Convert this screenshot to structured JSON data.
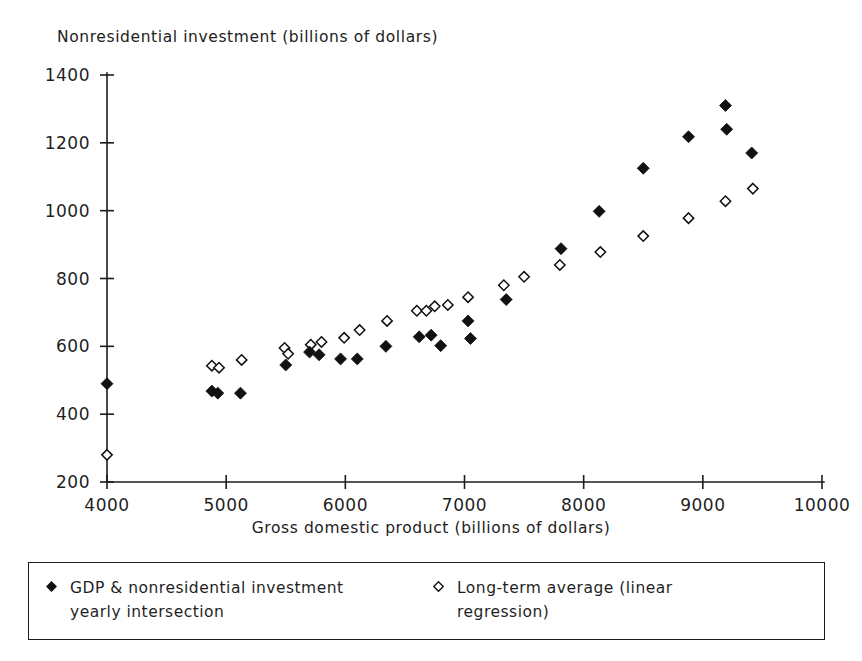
{
  "chart_data": {
    "type": "scatter",
    "title": "",
    "ylabel": "Nonresidential investment (billions of dollars)",
    "xlabel": "Gross domestic product (billions of dollars)",
    "xlim": [
      4000,
      10000
    ],
    "ylim": [
      200,
      1400
    ],
    "xticks": [
      4000,
      5000,
      6000,
      7000,
      8000,
      9000,
      10000
    ],
    "yticks": [
      200,
      400,
      600,
      800,
      1000,
      1200,
      1400
    ],
    "grid": false,
    "legend_position": "below-axes",
    "series": [
      {
        "name": "GDP & nonresidential investment yearly intersection",
        "marker": "filled-diamond",
        "color": "#111111",
        "points": [
          [
            4000,
            490
          ],
          [
            4880,
            468
          ],
          [
            4930,
            462
          ],
          [
            5120,
            462
          ],
          [
            5500,
            545
          ],
          [
            5700,
            583
          ],
          [
            5780,
            575
          ],
          [
            5960,
            563
          ],
          [
            6100,
            563
          ],
          [
            6340,
            600
          ],
          [
            6620,
            628
          ],
          [
            6720,
            633
          ],
          [
            6800,
            602
          ],
          [
            7030,
            675
          ],
          [
            7050,
            623
          ],
          [
            7350,
            738
          ],
          [
            7810,
            888
          ],
          [
            8130,
            998
          ],
          [
            8500,
            1125
          ],
          [
            8880,
            1218
          ],
          [
            9190,
            1310
          ],
          [
            9200,
            1240
          ],
          [
            9410,
            1170
          ]
        ]
      },
      {
        "name": "Long-term average (linear regression)",
        "marker": "open-diamond",
        "color": "#111111",
        "points": [
          [
            4000,
            280
          ],
          [
            4880,
            543
          ],
          [
            4940,
            537
          ],
          [
            5130,
            560
          ],
          [
            5490,
            595
          ],
          [
            5520,
            578
          ],
          [
            5710,
            605
          ],
          [
            5800,
            613
          ],
          [
            5990,
            625
          ],
          [
            6120,
            648
          ],
          [
            6350,
            675
          ],
          [
            6600,
            705
          ],
          [
            6680,
            705
          ],
          [
            6750,
            718
          ],
          [
            6860,
            722
          ],
          [
            7030,
            745
          ],
          [
            7330,
            780
          ],
          [
            7500,
            805
          ],
          [
            7800,
            840
          ],
          [
            8140,
            878
          ],
          [
            8500,
            925
          ],
          [
            8880,
            978
          ],
          [
            9190,
            1028
          ],
          [
            9420,
            1065
          ]
        ]
      }
    ]
  },
  "axis_titles": {
    "y": "Nonresidential investment (billions of dollars)",
    "x": "Gross domestic product (billions of dollars)"
  },
  "legend": {
    "entries": [
      {
        "marker": "filled-diamond",
        "label": "GDP & nonresidential investment\nyearly intersection"
      },
      {
        "marker": "open-diamond",
        "label": "Long-term average (linear\nregression)"
      }
    ]
  },
  "colors": {
    "axis": "#1c1c1c",
    "text": "#1f1f1f",
    "marker": "#111111",
    "background": "#ffffff"
  }
}
